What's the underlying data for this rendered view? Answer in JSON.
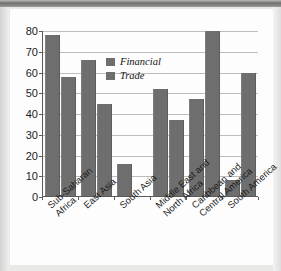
{
  "chart_data": {
    "type": "bar",
    "title": "",
    "subtitle": "",
    "xlabel": "",
    "ylabel": "",
    "ylim": [
      0,
      80
    ],
    "yticks": [
      0,
      10,
      20,
      30,
      40,
      50,
      60,
      70,
      80
    ],
    "grid": true,
    "legend_position": "inside-top-center",
    "categories": [
      "Sub-Saharan Africa",
      "East Asia",
      "South Asia",
      "Middle East and North Africa",
      "Caribbean and Central America",
      "South America"
    ],
    "category_lines": [
      [
        "Sub-Saharan",
        "Africa"
      ],
      [
        "East Asia"
      ],
      [
        "South Asia"
      ],
      [
        "Middle East and",
        "North Africa"
      ],
      [
        "Caribbean and",
        "Central America"
      ],
      [
        "South America"
      ]
    ],
    "series": [
      {
        "name": "Financial",
        "color": "#6e6e6e",
        "values": [
          78,
          66,
          16,
          52,
          47,
          8
        ]
      },
      {
        "name": "Trade",
        "color": "#6e6e6e",
        "values": [
          58,
          45,
          0,
          37,
          80,
          60
        ]
      }
    ]
  },
  "legend": {
    "items": [
      {
        "label": "Financial",
        "swatch_name": "legend-swatch-financial"
      },
      {
        "label": "Trade",
        "swatch_name": "legend-swatch-trade"
      }
    ]
  },
  "colors": {
    "bar": "#6e6e6e",
    "gridline": "#bdbdbd",
    "axis": "#5a5a5a",
    "card_background": "#fdfdfd",
    "page_background": "#e9e9e7",
    "text": "#1c1c1c"
  }
}
